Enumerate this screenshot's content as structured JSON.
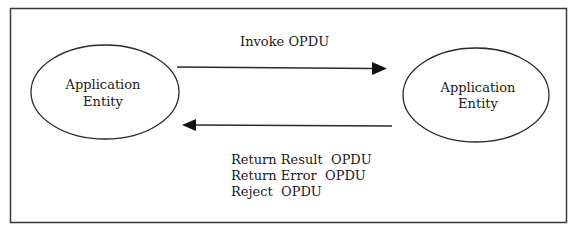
{
  "diagram": {
    "nodes": [
      {
        "id": "left",
        "label_lines": [
          "Application",
          "Entity"
        ]
      },
      {
        "id": "right",
        "label_lines": [
          "Application",
          "Entity"
        ]
      }
    ],
    "edges": [
      {
        "from": "left",
        "to": "right",
        "label": "Invoke OPDU"
      },
      {
        "from": "right",
        "to": "left",
        "labels": [
          "Return Result  OPDU",
          "Return Error  OPDU",
          "Reject  OPDU"
        ]
      }
    ]
  },
  "colors": {
    "stroke": "#2a2a2a",
    "background": "#ffffff"
  }
}
